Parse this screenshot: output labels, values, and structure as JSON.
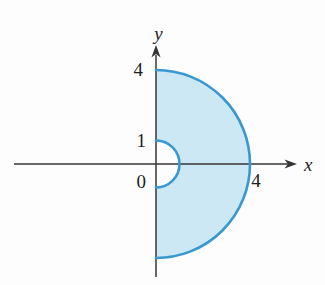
{
  "figure": {
    "axes": {
      "x_label": "x",
      "y_label": "y",
      "color": "#353535"
    },
    "ticks": {
      "y4": "4",
      "y1": "1",
      "origin": "0",
      "x4": "4"
    },
    "region": {
      "type": "half-annulus-right-half-plane",
      "inner_radius": 1,
      "outer_radius": 4,
      "fill": "#cde8f5",
      "stroke": "#3898cf"
    }
  }
}
